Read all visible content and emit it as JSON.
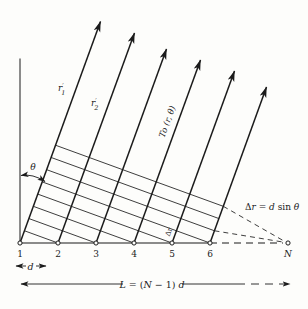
{
  "figure": {
    "ink_color": "#1b1b1b",
    "background_color": "#fdfdfb",
    "element_labels": [
      "1",
      "2",
      "3",
      "4",
      "5",
      "6"
    ],
    "last_element_label": "N",
    "ray_labels": {
      "r1": {
        "base": "r",
        "prime": "′",
        "sub": "1"
      },
      "r2": {
        "base": "r",
        "prime": "′",
        "sub": "2"
      }
    },
    "direction_label": "To (r, θ)",
    "theta_label": "θ",
    "delta_r_small_label": "Δr",
    "delta_r_equation": {
      "parts": [
        "Δ",
        "r",
        " = ",
        "d",
        " sin ",
        "θ"
      ]
    },
    "spacing_label": "d",
    "length_equation": {
      "parts": [
        "L",
        " = (",
        "N",
        " − 1) ",
        "d"
      ]
    }
  }
}
